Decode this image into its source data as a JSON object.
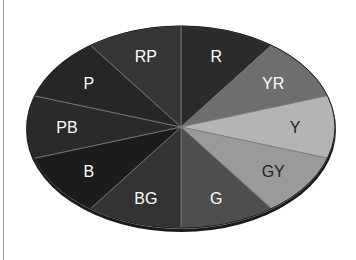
{
  "chart_data": {
    "type": "pie",
    "title": "",
    "style": "3d-elliptical",
    "categories": [
      "R",
      "YR",
      "Y",
      "GY",
      "G",
      "BG",
      "B",
      "PB",
      "P",
      "RP"
    ],
    "values": [
      10,
      10,
      10,
      10,
      10,
      10,
      10,
      10,
      10,
      10
    ],
    "colors": [
      "#2b2b2b",
      "#6e6e6e",
      "#b4b4b4",
      "#9a9a9a",
      "#4e4e4e",
      "#333333",
      "#1c1c1c",
      "#2a2a2a",
      "#262626",
      "#363636"
    ],
    "label_colors": [
      "#ffffff",
      "#ffffff",
      "#222222",
      "#222222",
      "#ffffff",
      "#ffffff",
      "#ffffff",
      "#ffffff",
      "#ffffff",
      "#ffffff"
    ],
    "start_angle_deg": 90,
    "direction": "clockwise",
    "legend": "none",
    "labels_inside": true
  },
  "slices": [
    {
      "label": "R"
    },
    {
      "label": "YR"
    },
    {
      "label": "Y"
    },
    {
      "label": "GY"
    },
    {
      "label": "G"
    },
    {
      "label": "BG"
    },
    {
      "label": "B"
    },
    {
      "label": "PB"
    },
    {
      "label": "P"
    },
    {
      "label": "RP"
    }
  ]
}
